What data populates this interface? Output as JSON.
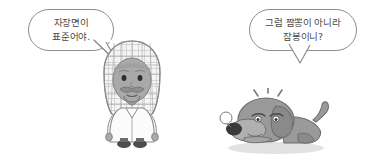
{
  "scene": {
    "width": 377,
    "height": 160,
    "background_color": "#ffffff",
    "type": "cartoon-comic-panel",
    "description": "Two-character Korean comic: a man in keffiyeh and white thobe speaking, and a grey dog lying down replying"
  },
  "bubbles": [
    {
      "id": "left",
      "speaker": "man-character",
      "tail_direction": "down-right",
      "lines": [
        "자장면이",
        "표준어야."
      ],
      "border_color": "#8d8d8d",
      "text_color": "#4a4a4a",
      "fill_color": "#ffffff"
    },
    {
      "id": "right",
      "speaker": "dog-character",
      "tail_direction": "down",
      "lines": [
        "그럼 짬뽕이 아니라",
        "잠봉이니?"
      ],
      "border_color": "#8d8d8d",
      "text_color": "#4a4a4a",
      "fill_color": "#ffffff"
    }
  ],
  "characters": [
    {
      "id": "man",
      "name": "man-in-keffiyeh",
      "headwear": "checkered keffiyeh (ghutrah)",
      "facial_hair": "mustache and goatee",
      "clothing": "white thobe robe",
      "footwear": "dark shoes",
      "colors": {
        "skin": "#a9a9a9",
        "keffiyeh": "#f2f2f2",
        "keffiyeh_lines": "#9a9a9a",
        "robe": "#fbfbfb",
        "robe_outline": "#8a8a8a",
        "shoes": "#4d4d4d",
        "eyes": "#2e2e2e"
      }
    },
    {
      "id": "dog",
      "name": "dog-lying-down",
      "pose": "lying down, head on ground",
      "expression": "droopy sleepy eyes with snot bubble",
      "effect_marks": "three radiating alert lines above head",
      "colors": {
        "body": "#9a9a9a",
        "body_shade": "#8a8a8a",
        "muzzle": "#b8b8b8",
        "nose": "#3a3a3a",
        "outline": "#6f6f6f",
        "shadow": "#d8d8d8",
        "bubble": "#ffffff"
      }
    }
  ]
}
